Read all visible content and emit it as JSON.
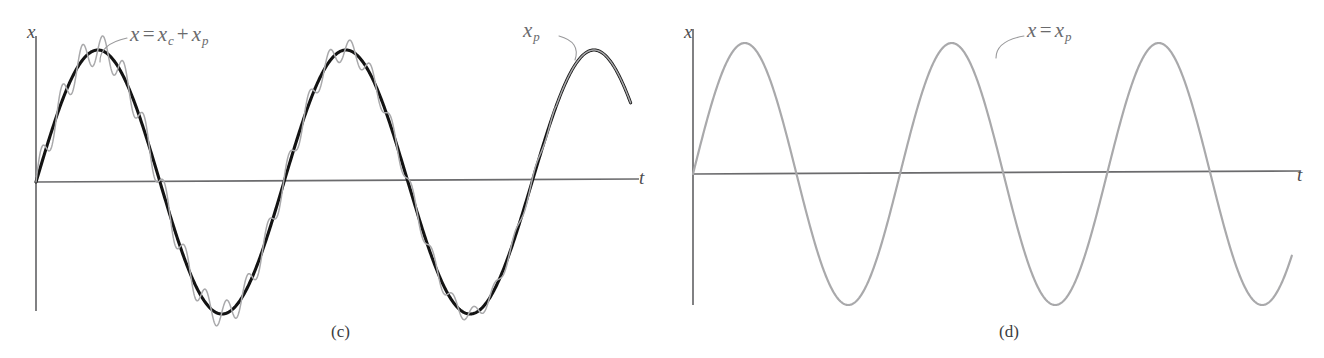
{
  "figure": {
    "background": "#ffffff",
    "width": 1324,
    "height": 358
  },
  "colors": {
    "axis": "#6b6b6d",
    "transient_gray": "#a9a9ab",
    "steady_black": "#131313",
    "leader": "#9a9a9c",
    "text": "#4d4d4f"
  },
  "panels": [
    {
      "id": "c",
      "caption": "(c)",
      "caption_x": 331,
      "caption_y": 322,
      "y_axis_label": "x",
      "y_axis_label_x": 27,
      "y_axis_label_y": 22,
      "x_axis_label": "t",
      "x_axis_label_x": 639,
      "x_axis_label_y": 168,
      "annotations": [
        {
          "name": "total-solution-label",
          "text_parts": [
            "x",
            "=",
            "x",
            "c",
            "+",
            "x",
            "p"
          ],
          "display": "x = x_c + x_p",
          "x": 130,
          "y": 24,
          "leader_from_x": 127,
          "leader_from_y": 38,
          "leader_to_x": 100,
          "leader_to_y": 62
        },
        {
          "name": "particular-solution-label",
          "text_parts": [
            "x",
            "p"
          ],
          "display": "x_p",
          "x": 523,
          "y": 20,
          "leader_from_x": 559,
          "leader_from_y": 36,
          "leader_to_x": 575,
          "leader_to_y": 60
        }
      ]
    },
    {
      "id": "d",
      "caption": "(d)",
      "caption_x": 999,
      "caption_y": 322,
      "y_axis_label": "x",
      "y_axis_label_x": 684,
      "y_axis_label_y": 22,
      "x_axis_label": "t",
      "x_axis_label_x": 1297,
      "x_axis_label_y": 165,
      "annotations": [
        {
          "name": "particular-solution-label",
          "text_parts": [
            "x",
            "=",
            "x",
            "p"
          ],
          "display": "x = x_p",
          "x": 1027,
          "y": 20,
          "leader_from_x": 1024,
          "leader_from_y": 36,
          "leader_to_x": 996,
          "leader_to_y": 58
        }
      ]
    }
  ],
  "chart_data": {
    "type": "line",
    "xlabel": "t",
    "ylabel": "x",
    "grid": false,
    "legend": false,
    "subplots": [
      {
        "id": "c",
        "caption": "(c)",
        "xlim": [
          0,
          2.42
        ],
        "ylim": [
          -1.25,
          1.25
        ],
        "origin_px": [
          36,
          182
        ],
        "x_axis_end_px": 631,
        "y_axis_top_px": 36,
        "y_axis_bottom_px": 311,
        "series": [
          {
            "name": "x = x_c + x_p",
            "role": "steady-state particular solution",
            "color": "#131313",
            "form": "A*sin(2*pi*t/T)",
            "amplitude_px": 132,
            "period_px": 248,
            "phase_px": 36,
            "start_px": 36,
            "end_px": 631,
            "zero_crossings_px": [
              36,
              160,
              284,
              408,
              532
            ],
            "peaks_px": [
              98,
              346,
              594
            ],
            "troughs_px": [
              222,
              470
            ],
            "linewidth": 3.1
          },
          {
            "name": "transient ripple (x_c superimposed)",
            "role": "complementary transient added to particular solution",
            "color": "#a9a9ab",
            "form": "A*sin(2*pi*t/T) + a(t)*sin(2*pi*t/Tr)",
            "carrier_amplitude_px": 132,
            "carrier_period_px": 248,
            "ripple_period_px": 20.6,
            "ripple_amplitude_px": 16,
            "ripple_decay": "slow, fades to zero near t_end",
            "fade_out_px": 556,
            "start_px": 36,
            "linewidth": 1.5
          }
        ]
      },
      {
        "id": "d",
        "caption": "(d)",
        "xlim": [
          0,
          2.42
        ],
        "ylim": [
          -1.25,
          1.25
        ],
        "origin_px": [
          693,
          174
        ],
        "x_axis_end_px": 1292,
        "y_axis_top_px": 29,
        "y_axis_bottom_px": 305,
        "series": [
          {
            "name": "x = x_p",
            "role": "steady-state particular solution only",
            "color": "#a9a9ab",
            "form": "A*sin(2*pi*t/T)",
            "amplitude_px": 131,
            "period_px": 207,
            "phase_px": 693,
            "start_px": 693,
            "end_px": 1292,
            "zero_crossings_px": [
              693,
              797,
              900,
              1004,
              1107,
              1211
            ],
            "peaks_px": [
              745,
              952,
              1159
            ],
            "troughs_px": [
              848,
              1055
            ],
            "linewidth": 2.2
          }
        ]
      }
    ]
  }
}
